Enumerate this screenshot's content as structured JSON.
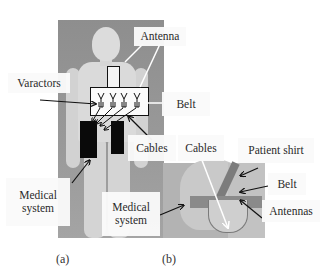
{
  "figure": {
    "panel_a": {
      "caption": "(a)",
      "labels": {
        "antenna": "Antenna",
        "varactors": "Varactors",
        "belt": "Belt",
        "cables": "Cables",
        "medical_system_left": "Medical system",
        "medical_system_right": "Medical system"
      }
    },
    "panel_b": {
      "caption": "(b)",
      "labels": {
        "cables": "Cables",
        "patient_shirt": "Patient shirt",
        "belt": "Belt",
        "antennas": "Antennas"
      }
    },
    "colors": {
      "background": "#ffffff",
      "photo_gray": "#9a9a9a",
      "device_black": "#0a0a0a",
      "arrow": "#111111",
      "callout_white": "#ffffff"
    }
  }
}
